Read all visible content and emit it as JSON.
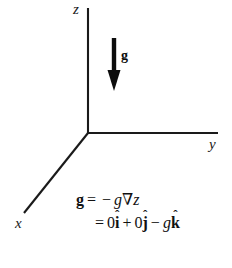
{
  "figure": {
    "background_color": "#ffffff",
    "stroke_color": "#1a1a1a",
    "axes": {
      "z": {
        "label": "z"
      },
      "y": {
        "label": "y"
      },
      "x": {
        "label": "x"
      }
    },
    "vector": {
      "label": "g",
      "direction": "down"
    }
  },
  "equations": {
    "line1": {
      "lhs": "g",
      "equals": "=",
      "minus": "−",
      "scalar": "g",
      "nabla": "∇",
      "variable": "z"
    },
    "line2": {
      "equals": "=",
      "zero_i": "0",
      "i": "i",
      "i_hat": "ˆ",
      "plus": "+",
      "zero_j": "0",
      "j": "j",
      "j_hat": "ˆ",
      "minus": "−",
      "scalar": "g",
      "k": "k",
      "k_hat": "ˆ"
    }
  }
}
